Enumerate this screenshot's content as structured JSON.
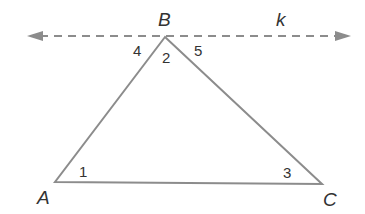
{
  "diagram": {
    "type": "geometry-triangle-with-parallel-line",
    "line": {
      "label": "k",
      "style": "dashed",
      "color": "#8c8c8c"
    },
    "triangle": {
      "color": "#8c8c8c",
      "vertices": [
        "A",
        "B",
        "C"
      ]
    },
    "vertex_labels": {
      "A": "A",
      "B": "B",
      "C": "C"
    },
    "angle_labels": {
      "a1": "1",
      "a2": "2",
      "a3": "3",
      "a4": "4",
      "a5": "5"
    },
    "line_label": "k"
  }
}
